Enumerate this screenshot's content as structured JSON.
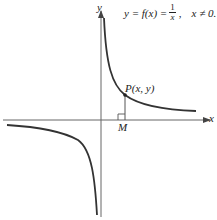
{
  "figure": {
    "equation": {
      "lhs": "y = f(x) =",
      "numerator": "1",
      "denominator": "x",
      "condition": "x ≠ 0."
    },
    "axis_labels": {
      "x": "x",
      "y": "y"
    },
    "point_label": "P(x, y)",
    "foot_label": "M",
    "colors": {
      "curve": "#333333",
      "axes": "#666666"
    }
  }
}
